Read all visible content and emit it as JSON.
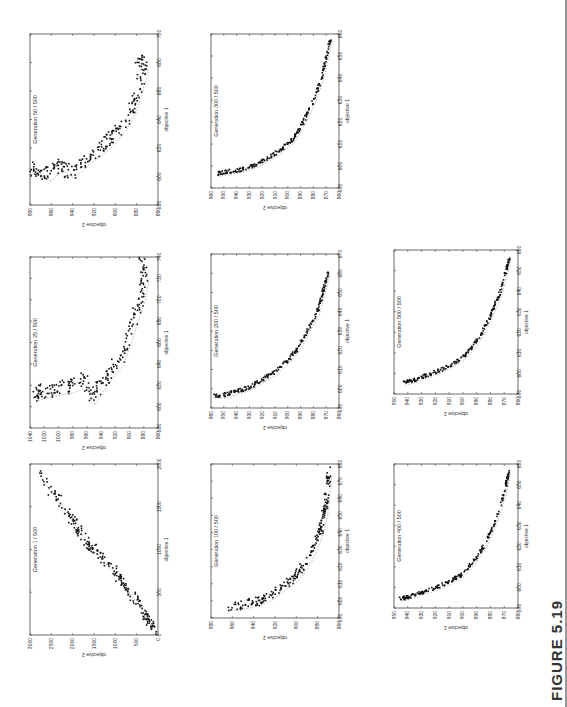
{
  "figure": {
    "label": "FIGURE 5.19"
  },
  "chart_data": [
    {
      "type": "scatter",
      "title": "Generation 1 / 500",
      "xlabel": "objective 1",
      "ylabel": "objective 2",
      "xlim": [
        0,
        2000
      ],
      "ylim": [
        0,
        3000
      ],
      "xticks": [
        0,
        500,
        1000,
        1500,
        2000
      ],
      "yticks": [
        0,
        500,
        1000,
        1500,
        2000,
        2500,
        3000
      ],
      "note": "points spread roughly linearly from (0,0) to (~1850, ~2750); pareto front dashed",
      "points_sample": [
        [
          20,
          30
        ],
        [
          80,
          120
        ],
        [
          150,
          220
        ],
        [
          250,
          330
        ],
        [
          350,
          450
        ],
        [
          450,
          600
        ],
        [
          550,
          750
        ],
        [
          650,
          900
        ],
        [
          750,
          1050
        ],
        [
          850,
          1250
        ],
        [
          950,
          1400
        ],
        [
          1000,
          1600
        ],
        [
          1100,
          1700
        ],
        [
          1250,
          1900
        ],
        [
          1400,
          2100
        ],
        [
          1550,
          2300
        ],
        [
          1700,
          2550
        ],
        [
          1850,
          2750
        ]
      ]
    },
    {
      "type": "scatter",
      "title": "Generation 25 / 500",
      "xlabel": "objective 1",
      "ylabel": "objective 2",
      "xlim": [
        580,
        740
      ],
      "ylim": [
        860,
        1040
      ],
      "xticks": [
        580,
        600,
        620,
        640,
        660,
        680,
        700,
        720,
        740
      ],
      "yticks": [
        860,
        880,
        900,
        920,
        940,
        960,
        980,
        1000,
        1020,
        1040
      ],
      "points_sample": [
        [
          607,
          1030
        ],
        [
          610,
          1020
        ],
        [
          612,
          1000
        ],
        [
          615,
          980
        ],
        [
          620,
          960
        ],
        [
          603,
          950
        ],
        [
          625,
          930
        ],
        [
          640,
          910
        ],
        [
          660,
          900
        ],
        [
          680,
          890
        ],
        [
          700,
          880
        ],
        [
          718,
          875
        ],
        [
          735,
          882
        ]
      ]
    },
    {
      "type": "scatter",
      "title": "Generation 50 / 500",
      "xlabel": "objective 1",
      "ylabel": "objective 2",
      "xlim": [
        580,
        700
      ],
      "ylim": [
        860,
        980
      ],
      "xticks": [
        580,
        600,
        620,
        640,
        660,
        680,
        700
      ],
      "yticks": [
        860,
        880,
        900,
        920,
        940,
        960,
        980
      ],
      "points_sample": [
        [
          603,
          978
        ],
        [
          602,
          972
        ],
        [
          598,
          962
        ],
        [
          605,
          950
        ],
        [
          600,
          940
        ],
        [
          610,
          925
        ],
        [
          618,
          910
        ],
        [
          625,
          900
        ],
        [
          635,
          890
        ],
        [
          645,
          882
        ],
        [
          660,
          876
        ],
        [
          675,
          870
        ],
        [
          682,
          878
        ]
      ]
    },
    {
      "type": "scatter",
      "title": "Generation 100 / 500",
      "xlabel": "objective 1",
      "ylabel": "objective 2",
      "xlim": [
        590,
        680
      ],
      "ylim": [
        860,
        980
      ],
      "xticks": [
        590,
        600,
        610,
        620,
        630,
        640,
        650,
        660,
        670,
        680
      ],
      "yticks": [
        860,
        880,
        900,
        920,
        940,
        960,
        980
      ],
      "points_sample": [
        [
          595,
          962
        ],
        [
          596,
          950
        ],
        [
          598,
          935
        ],
        [
          602,
          922
        ],
        [
          608,
          910
        ],
        [
          612,
          900
        ],
        [
          620,
          890
        ],
        [
          630,
          882
        ],
        [
          640,
          876
        ],
        [
          650,
          872
        ],
        [
          660,
          870
        ],
        [
          675,
          868
        ]
      ]
    },
    {
      "type": "scatter",
      "title": "Generation 200 / 500",
      "xlabel": "objective 1",
      "ylabel": "objective 2",
      "xlim": [
        590,
        670
      ],
      "ylim": [
        860,
        960
      ],
      "xticks": [
        590,
        600,
        610,
        620,
        630,
        640,
        650,
        660,
        670
      ],
      "yticks": [
        860,
        870,
        880,
        890,
        900,
        910,
        920,
        930,
        940,
        950,
        960
      ],
      "points_sample": [
        [
          596,
          958
        ],
        [
          596,
          950
        ],
        [
          598,
          940
        ],
        [
          600,
          930
        ],
        [
          604,
          920
        ],
        [
          608,
          910
        ],
        [
          614,
          900
        ],
        [
          620,
          892
        ],
        [
          630,
          884
        ],
        [
          640,
          876
        ],
        [
          650,
          872
        ],
        [
          660,
          868
        ]
      ]
    },
    {
      "type": "scatter",
      "title": "Generation 300 / 500",
      "xlabel": "objective 1",
      "ylabel": "objective 2",
      "xlim": [
        590,
        660
      ],
      "ylim": [
        860,
        960
      ],
      "xticks": [
        590,
        600,
        610,
        620,
        630,
        640,
        650,
        660
      ],
      "yticks": [
        860,
        870,
        880,
        890,
        900,
        910,
        920,
        930,
        940,
        950,
        960
      ],
      "points_sample": [
        [
          596,
          955
        ],
        [
          597,
          945
        ],
        [
          598,
          935
        ],
        [
          600,
          925
        ],
        [
          603,
          915
        ],
        [
          607,
          905
        ],
        [
          612,
          895
        ],
        [
          620,
          887
        ],
        [
          630,
          879
        ],
        [
          640,
          873
        ],
        [
          650,
          869
        ],
        [
          658,
          866
        ]
      ]
    },
    {
      "type": "scatter",
      "title": "Generation 400 / 500",
      "xlabel": "objective 1",
      "ylabel": "objective 2",
      "xlim": [
        590,
        660
      ],
      "ylim": [
        860,
        950
      ],
      "xticks": [
        590,
        600,
        610,
        620,
        630,
        640,
        650,
        660
      ],
      "yticks": [
        860,
        870,
        880,
        890,
        900,
        910,
        920,
        930,
        940,
        950
      ],
      "points_sample": [
        [
          594,
          945
        ],
        [
          595,
          938
        ],
        [
          597,
          930
        ],
        [
          599,
          920
        ],
        [
          602,
          910
        ],
        [
          606,
          900
        ],
        [
          612,
          892
        ],
        [
          620,
          884
        ],
        [
          630,
          877
        ],
        [
          640,
          872
        ],
        [
          650,
          868
        ],
        [
          657,
          866
        ]
      ]
    },
    {
      "type": "scatter",
      "title": "Generation 500 / 500",
      "xlabel": "objective 1",
      "ylabel": "objective 2",
      "xlim": [
        590,
        660
      ],
      "ylim": [
        860,
        950
      ],
      "xticks": [
        590,
        600,
        610,
        620,
        630,
        640,
        650,
        660
      ],
      "yticks": [
        860,
        870,
        880,
        890,
        900,
        910,
        920,
        930,
        940,
        950
      ],
      "points_sample": [
        [
          595,
          943
        ],
        [
          596,
          936
        ],
        [
          598,
          928
        ],
        [
          600,
          920
        ],
        [
          603,
          910
        ],
        [
          607,
          900
        ],
        [
          613,
          892
        ],
        [
          620,
          885
        ],
        [
          630,
          878
        ],
        [
          640,
          872
        ],
        [
          650,
          868
        ],
        [
          655,
          866
        ]
      ]
    }
  ]
}
